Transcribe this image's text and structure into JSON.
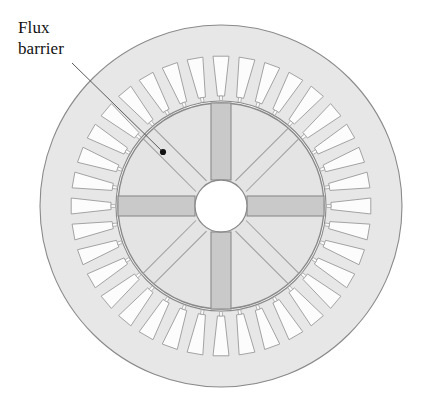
{
  "figure": {
    "annotations": [
      {
        "id": "flux-barrier",
        "text": "Flux\nbarrier",
        "label_x": 18,
        "label_y": 18,
        "leader_from_x": 72,
        "leader_from_y": 63,
        "leader_to_x": 163,
        "leader_to_y": 152,
        "marker_x": 163,
        "marker_y": 152,
        "marker_radius": 3.1
      }
    ],
    "colors": {
      "background": "#ffffff",
      "stator_fill": "#e7e7e7",
      "stator_stroke": "#8a8a8a",
      "slot_fill": "#fcfcfc",
      "slot_stroke": "#9a9a9a",
      "rotor_fill": "#e4e4e4",
      "rotor_stroke": "#8a8a8a",
      "barrier_fill": "#c9c9c9",
      "barrier_stroke": "#8a8a8a",
      "diagonal_stroke": "#9e9e9e",
      "shaft_fill": "#ffffff",
      "shaft_stroke": "#8a8a8a",
      "marker_fill": "#111111",
      "leader_stroke": "#5a5a5a",
      "text": "#111111"
    }
  },
  "chart_data": {
    "type": "diagram",
    "subtype": "electrical-machine-cross-section",
    "title": "Flux barrier",
    "geometry": {
      "center_x": 221,
      "center_y": 206,
      "stator_outer_radius": 181,
      "stator_bore_radius": 105,
      "slot_inner_radius": 110,
      "slot_outer_radius": 150,
      "slot_count": 36,
      "slot_inner_half_angle_deg": 1.85,
      "slot_outer_half_angle_deg": 3.05,
      "slot_start_angle_deg": 270,
      "rotor_outer_radius": 103,
      "shaft_radius": 26,
      "barrier_count": 4,
      "barrier_angles_deg": [
        0,
        90,
        180,
        270
      ],
      "barrier_half_width": 10,
      "barrier_inner_radius": 26,
      "barrier_outer_radius": 103,
      "diagonal_count": 4,
      "diagonal_angles_deg": [
        45,
        135,
        225,
        315
      ],
      "diagonal_half_width": 7.5,
      "diagonal_inner_radius": 28,
      "diagonal_outer_radius": 103
    }
  }
}
